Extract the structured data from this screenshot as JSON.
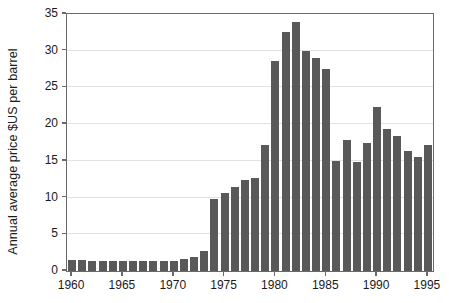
{
  "chart_data": {
    "type": "bar",
    "title": "",
    "xlabel": "",
    "ylabel": "Annual average price $US per barrel",
    "ylim": [
      0,
      35
    ],
    "ytick_labels": [
      "0",
      "5",
      "10",
      "15",
      "20",
      "25",
      "30",
      "35"
    ],
    "ytick_values": [
      0,
      5,
      10,
      15,
      20,
      25,
      30,
      35
    ],
    "xtick_labels": [
      "1960",
      "1965",
      "1970",
      "1975",
      "1980",
      "1985",
      "1990",
      "1995"
    ],
    "xtick_values": [
      1960,
      1965,
      1970,
      1975,
      1980,
      1985,
      1990,
      1995
    ],
    "xlim": [
      1959.5,
      1995.5
    ],
    "grid": "horizontal",
    "legend": "none",
    "bar_color": "#595959",
    "axis_color": "#6a6a6a",
    "grid_color": "#e2e2e2",
    "categories": [
      "1960",
      "1961",
      "1962",
      "1963",
      "1964",
      "1965",
      "1966",
      "1967",
      "1968",
      "1969",
      "1970",
      "1971",
      "1972",
      "1973",
      "1974",
      "1975",
      "1976",
      "1977",
      "1978",
      "1979",
      "1980",
      "1981",
      "1982",
      "1983",
      "1984",
      "1985",
      "1986",
      "1987",
      "1988",
      "1989",
      "1990",
      "1991",
      "1992",
      "1993",
      "1994",
      "1995"
    ],
    "values": [
      1.5,
      1.5,
      1.4,
      1.4,
      1.4,
      1.4,
      1.4,
      1.4,
      1.3,
      1.3,
      1.3,
      1.7,
      1.9,
      2.7,
      9.8,
      10.6,
      11.5,
      12.4,
      12.6,
      17.2,
      28.6,
      32.5,
      33.9,
      30.0,
      29.0,
      27.5,
      15.0,
      17.8,
      14.8,
      17.4,
      22.3,
      19.3,
      18.4,
      16.3,
      15.5,
      17.2
    ]
  }
}
